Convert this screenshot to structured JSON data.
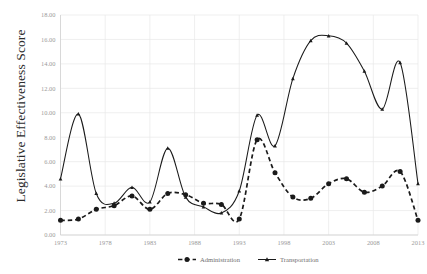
{
  "chart_data": {
    "type": "line",
    "title": "",
    "xlabel": "",
    "ylabel": "Legislative Effectiveness Score",
    "xlim": [
      1973,
      2013
    ],
    "ylim": [
      0,
      18
    ],
    "ytick_labels": [
      "0.00",
      "2.00",
      "4.00",
      "6.00",
      "8.00",
      "10.00",
      "12.00",
      "14.00",
      "16.00",
      "18.00"
    ],
    "ytick_values": [
      0,
      2,
      4,
      6,
      8,
      10,
      12,
      14,
      16,
      18
    ],
    "xtick_labels": [
      "1973",
      "1978",
      "1983",
      "1988",
      "1993",
      "1998",
      "2003",
      "2008",
      "2013"
    ],
    "xtick_values": [
      1973,
      1978,
      1983,
      1988,
      1993,
      1998,
      2003,
      2008,
      2013
    ],
    "grid": true,
    "legend_position": "bottom",
    "x": [
      1973,
      1975,
      1977,
      1979,
      1981,
      1983,
      1985,
      1987,
      1989,
      1991,
      1993,
      1995,
      1997,
      1999,
      2001,
      2003,
      2005,
      2007,
      2009,
      2011,
      2013
    ],
    "series": [
      {
        "name": "Administration",
        "style": "dashed",
        "marker": "circle",
        "color": "#1a1a1a",
        "values": [
          1.2,
          1.3,
          2.1,
          2.4,
          3.2,
          2.1,
          3.4,
          3.3,
          2.6,
          2.5,
          1.3,
          7.8,
          5.1,
          3.1,
          3.0,
          4.2,
          4.6,
          3.5,
          4.0,
          5.2,
          1.2
        ]
      },
      {
        "name": "Transportation",
        "style": "solid",
        "marker": "triangle",
        "color": "#1a1a1a",
        "values": [
          4.6,
          9.9,
          3.4,
          2.6,
          3.9,
          2.7,
          7.1,
          3.1,
          2.3,
          1.8,
          3.6,
          9.8,
          7.3,
          12.8,
          15.9,
          16.3,
          15.7,
          13.4,
          10.3,
          14.1,
          4.2
        ]
      }
    ]
  },
  "legend": {
    "items": [
      {
        "label": "Administration",
        "style": "dashed"
      },
      {
        "label": "Transportation",
        "style": "solid"
      }
    ]
  },
  "axis": {
    "y_title": "Legislative Effectiveness Score"
  }
}
